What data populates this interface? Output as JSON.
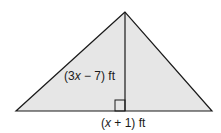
{
  "figure": {
    "shape": "triangle",
    "fill_color": "#e6e6e6",
    "stroke_color": "#1a1a1a",
    "height_label": {
      "open": "(3",
      "var": "x",
      "rest": " − 7) ft",
      "full": "(3x − 7) ft"
    },
    "base_label": {
      "open": "(",
      "var": "x",
      "rest": " + 1) ft",
      "full": "(x + 1) ft"
    },
    "right_angle_marker": true
  }
}
